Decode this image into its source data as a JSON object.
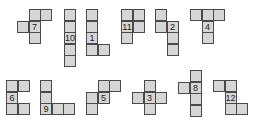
{
  "figure": {
    "title": "",
    "cell_size": 12,
    "cell_fill": "#d6d6d6",
    "cell_border": "#4a4a4a",
    "shapes": [
      {
        "id": "7",
        "x": 17,
        "y": 9,
        "cells": [
          [
            1,
            0
          ],
          [
            2,
            0
          ],
          [
            0,
            1
          ],
          [
            1,
            1
          ],
          [
            1,
            2
          ]
        ],
        "label_cell": [
          1,
          1
        ]
      },
      {
        "id": "10",
        "x": 64,
        "y": 9,
        "cells": [
          [
            0,
            0
          ],
          [
            0,
            1
          ],
          [
            0,
            2
          ],
          [
            0,
            3
          ],
          [
            0,
            4
          ]
        ],
        "label_cell": [
          0,
          2
        ]
      },
      {
        "id": "1",
        "x": 86,
        "y": 9,
        "cells": [
          [
            0,
            0
          ],
          [
            0,
            1
          ],
          [
            0,
            2
          ],
          [
            0,
            3
          ],
          [
            1,
            3
          ]
        ],
        "label_cell": [
          0,
          2
        ]
      },
      {
        "id": "11",
        "x": 121,
        "y": 9,
        "cells": [
          [
            0,
            0
          ],
          [
            1,
            0
          ],
          [
            0,
            1
          ],
          [
            1,
            1
          ],
          [
            0,
            2
          ]
        ],
        "label_cell": [
          0,
          1
        ]
      },
      {
        "id": "2",
        "x": 155,
        "y": 9,
        "cells": [
          [
            0,
            0
          ],
          [
            0,
            1
          ],
          [
            1,
            1
          ],
          [
            1,
            2
          ],
          [
            1,
            3
          ]
        ],
        "label_cell": [
          1,
          1
        ]
      },
      {
        "id": "4",
        "x": 190,
        "y": 9,
        "cells": [
          [
            0,
            0
          ],
          [
            1,
            0
          ],
          [
            2,
            0
          ],
          [
            1,
            1
          ],
          [
            1,
            2
          ]
        ],
        "label_cell": [
          1,
          1
        ]
      },
      {
        "id": "6",
        "x": 6,
        "y": 80,
        "cells": [
          [
            0,
            0
          ],
          [
            1,
            0
          ],
          [
            0,
            1
          ],
          [
            0,
            2
          ],
          [
            1,
            2
          ]
        ],
        "label_cell": [
          0,
          1
        ]
      },
      {
        "id": "9",
        "x": 40,
        "y": 80,
        "cells": [
          [
            0,
            0
          ],
          [
            0,
            1
          ],
          [
            0,
            2
          ],
          [
            1,
            2
          ],
          [
            2,
            2
          ]
        ],
        "label_cell": [
          0,
          2
        ]
      },
      {
        "id": "5",
        "x": 86,
        "y": 80,
        "cells": [
          [
            1,
            0
          ],
          [
            2,
            0
          ],
          [
            0,
            1
          ],
          [
            1,
            1
          ],
          [
            0,
            2
          ]
        ],
        "label_cell": [
          1,
          1
        ]
      },
      {
        "id": "3",
        "x": 132,
        "y": 80,
        "cells": [
          [
            1,
            0
          ],
          [
            0,
            1
          ],
          [
            1,
            1
          ],
          [
            2,
            1
          ],
          [
            1,
            2
          ]
        ],
        "label_cell": [
          1,
          1
        ]
      },
      {
        "id": "8",
        "x": 178,
        "y": 70,
        "cells": [
          [
            1,
            0
          ],
          [
            0,
            1
          ],
          [
            1,
            1
          ],
          [
            1,
            2
          ],
          [
            1,
            3
          ]
        ],
        "label_cell": [
          1,
          1
        ]
      },
      {
        "id": "12",
        "x": 213,
        "y": 80,
        "cells": [
          [
            0,
            0
          ],
          [
            1,
            0
          ],
          [
            1,
            1
          ],
          [
            1,
            2
          ],
          [
            2,
            2
          ]
        ],
        "label_cell": [
          1,
          1
        ]
      }
    ]
  }
}
